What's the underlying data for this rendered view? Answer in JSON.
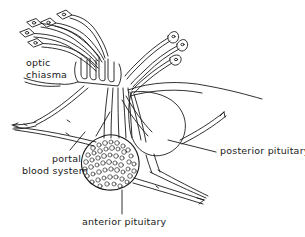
{
  "figure": {
    "type": "line-drawing",
    "background_color": "#ffffff",
    "ink_color": "#1a1a1a"
  },
  "labels": {
    "optic_chiasma": {
      "line1": "optic",
      "line2": "chiasma"
    },
    "portal_blood_system": {
      "line1": "portal",
      "line2": "blood system"
    },
    "anterior_pituitary": "anterior pituitary",
    "posterior_pituitary": "posterior pituitary"
  },
  "structures": {
    "neurosecretory_cells_left": "cluster of four lozenge-shaped neurosecretory cell bodies with nuclei, axons running right",
    "neurosecretory_cells_right": "cluster of three lens-shaped neurosecretory cell bodies with nuclei, axons fanning down-left",
    "optic_chiasma": "crossed nerve tracts left of the stalk",
    "pituitary_stalk": "infundibulum bundle of axons descending from hypothalamus",
    "anterior_pituitary": "rounded granular lobe filled with small secretory cells",
    "posterior_pituitary": "large smooth teardrop lobe to the right of the stalk",
    "portal_blood_system": "capillary vessels with arrowheads running to the left and lower right"
  }
}
